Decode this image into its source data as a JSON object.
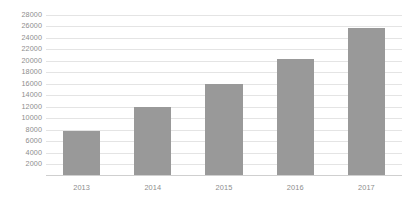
{
  "chart_data": {
    "type": "bar",
    "title": "",
    "subtitle": "",
    "xlabel": "",
    "ylabel": "",
    "categories": [
      "2013",
      "2014",
      "2015",
      "2016",
      "2017"
    ],
    "values": [
      7800,
      12000,
      16000,
      20300,
      25600
    ],
    "series": [
      {
        "name": "",
        "values": [
          7800,
          12000,
          16000,
          20300,
          25600
        ]
      }
    ],
    "ylim": [
      0,
      28800
    ],
    "ytick_values": [
      2000,
      4000,
      6000,
      8000,
      10000,
      12000,
      14000,
      16000,
      18000,
      20000,
      22000,
      24000,
      26000,
      28000
    ],
    "ytick_labels": [
      "2000",
      "4000",
      "6000",
      "8000",
      "10000",
      "12000",
      "14000",
      "16000",
      "18000",
      "20000",
      "22000",
      "24000",
      "26000",
      "28000"
    ],
    "ytick_step": 2000,
    "xtick_labels": [
      "2013",
      "2014",
      "2015",
      "2016",
      "2017"
    ],
    "grid": true,
    "grid_axis": "y",
    "legend": false,
    "legend_position": "none",
    "annotations": [],
    "colors": {
      "bar": "#999999",
      "gridline": "#e4e4e4",
      "axis_line": "#cfcfcf",
      "tick_label": "#8d8d8d",
      "background": "#ffffff"
    }
  }
}
